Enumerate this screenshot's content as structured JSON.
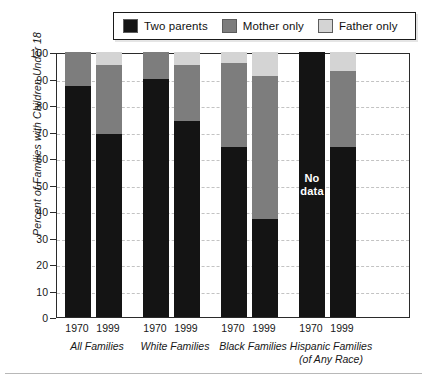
{
  "legend": {
    "entries": [
      {
        "label": "Two parents",
        "color": "#141414",
        "icon": "legend-swatch-two-parents"
      },
      {
        "label": "Mother only",
        "color": "#7d7d7d",
        "icon": "legend-swatch-mother-only"
      },
      {
        "label": "Father only",
        "color": "#d4d4d4",
        "icon": "legend-swatch-father-only"
      }
    ]
  },
  "axes": {
    "ylabel": "Percent of Families with Children Under 18",
    "yticks": [
      "100",
      "90",
      "80",
      "70",
      "60",
      "50",
      "40",
      "30",
      "20",
      "10",
      "0"
    ],
    "ymin": 0,
    "ymax": 100,
    "years": [
      "1970",
      "1999",
      "1970",
      "1999",
      "1970",
      "1999",
      "1970",
      "1999"
    ],
    "groups": [
      "All Families",
      "White Families",
      "Black Families",
      "Hispanic Families\n(of Any Race)"
    ]
  },
  "annotations": {
    "no_data": "No\ndata"
  },
  "chart_data": {
    "type": "bar",
    "title": "",
    "subtype": "stacked-vertical",
    "xlabel": "",
    "ylabel": "Percent of Families with Children Under 18",
    "ylim": [
      0,
      100
    ],
    "yticks": [
      0,
      10,
      20,
      30,
      40,
      50,
      60,
      70,
      80,
      90,
      100
    ],
    "grid": true,
    "legend_position": "top",
    "categories": [
      "All Families 1970",
      "All Families 1999",
      "White Families 1970",
      "White Families 1999",
      "Black Families 1970",
      "Black Families 1999",
      "Hispanic Families 1970",
      "Hispanic Families 1999"
    ],
    "groups": [
      {
        "name": "All Families",
        "years": [
          "1970",
          "1999"
        ]
      },
      {
        "name": "White Families",
        "years": [
          "1970",
          "1999"
        ]
      },
      {
        "name": "Black Families",
        "years": [
          "1970",
          "1999"
        ]
      },
      {
        "name": "Hispanic Families (of Any Race)",
        "years": [
          "1970",
          "1999"
        ]
      }
    ],
    "series": [
      {
        "name": "Two parents",
        "color": "#141414",
        "values": [
          87,
          69,
          90,
          74,
          64,
          37,
          null,
          64
        ]
      },
      {
        "name": "Mother only",
        "color": "#7d7d7d",
        "values": [
          13,
          26,
          10,
          21,
          32,
          54,
          null,
          29
        ]
      },
      {
        "name": "Father only",
        "color": "#d4d4d4",
        "values": [
          0,
          5,
          0,
          5,
          4,
          9,
          null,
          7
        ]
      }
    ],
    "bars": [
      {
        "category": "All Families 1970",
        "no_data": false,
        "segments": [
          {
            "name": "Two parents",
            "value": 87,
            "color": "#141414"
          },
          {
            "name": "Mother only",
            "value": 13,
            "color": "#7d7d7d"
          },
          {
            "name": "Father only",
            "value": 0,
            "color": "#d4d4d4"
          }
        ]
      },
      {
        "category": "All Families 1999",
        "no_data": false,
        "segments": [
          {
            "name": "Two parents",
            "value": 69,
            "color": "#141414"
          },
          {
            "name": "Mother only",
            "value": 26,
            "color": "#7d7d7d"
          },
          {
            "name": "Father only",
            "value": 5,
            "color": "#d4d4d4"
          }
        ]
      },
      {
        "category": "White Families 1970",
        "no_data": false,
        "segments": [
          {
            "name": "Two parents",
            "value": 90,
            "color": "#141414"
          },
          {
            "name": "Mother only",
            "value": 10,
            "color": "#7d7d7d"
          },
          {
            "name": "Father only",
            "value": 0,
            "color": "#d4d4d4"
          }
        ]
      },
      {
        "category": "White Families 1999",
        "no_data": false,
        "segments": [
          {
            "name": "Two parents",
            "value": 74,
            "color": "#141414"
          },
          {
            "name": "Mother only",
            "value": 21,
            "color": "#7d7d7d"
          },
          {
            "name": "Father only",
            "value": 5,
            "color": "#d4d4d4"
          }
        ]
      },
      {
        "category": "Black Families 1970",
        "no_data": false,
        "segments": [
          {
            "name": "Two parents",
            "value": 64,
            "color": "#141414"
          },
          {
            "name": "Mother only",
            "value": 32,
            "color": "#7d7d7d"
          },
          {
            "name": "Father only",
            "value": 4,
            "color": "#d4d4d4"
          }
        ]
      },
      {
        "category": "Black Families 1999",
        "no_data": false,
        "segments": [
          {
            "name": "Two parents",
            "value": 37,
            "color": "#141414"
          },
          {
            "name": "Mother only",
            "value": 54,
            "color": "#7d7d7d"
          },
          {
            "name": "Father only",
            "value": 9,
            "color": "#d4d4d4"
          }
        ]
      },
      {
        "category": "Hispanic Families 1970",
        "no_data": true,
        "label": "No\ndata",
        "segments": [
          {
            "name": "No data",
            "value": 100,
            "color": "#141414"
          }
        ]
      },
      {
        "category": "Hispanic Families 1999",
        "no_data": false,
        "segments": [
          {
            "name": "Two parents",
            "value": 64,
            "color": "#141414"
          },
          {
            "name": "Mother only",
            "value": 29,
            "color": "#7d7d7d"
          },
          {
            "name": "Father only",
            "value": 7,
            "color": "#d4d4d4"
          }
        ]
      }
    ]
  },
  "layout": {
    "bar_left_px": [
      8,
      39,
      86,
      117,
      164,
      195,
      242,
      273
    ],
    "bar_width_px": 26,
    "group_center_px": [
      97,
      175,
      253,
      331
    ],
    "year_center_px": [
      77,
      108,
      155,
      186,
      233,
      264,
      311,
      342
    ]
  }
}
